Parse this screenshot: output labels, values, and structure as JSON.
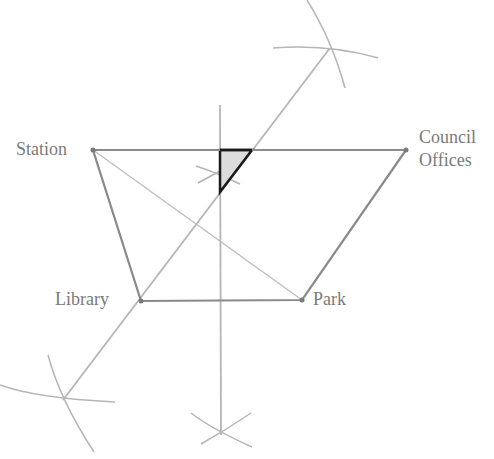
{
  "diagram": {
    "title": "",
    "colors": {
      "construction": "#b5b5b5",
      "quadrilateral": "#8a8a8a",
      "diagonal": "#bdbdbd",
      "triangle_stroke": "#1a1a1a",
      "triangle_fill": "#dcdcdc",
      "label": "#7a7a7a"
    },
    "points": {
      "station": {
        "label": "Station",
        "x": 93,
        "y": 150
      },
      "council_offices": {
        "label_line1": "Council",
        "label_line2": "Offices",
        "x": 406,
        "y": 150
      },
      "library": {
        "label": "Library",
        "x": 141,
        "y": 301
      },
      "park": {
        "label": "Park",
        "x": 302,
        "y": 300
      }
    },
    "construction_lines": {
      "angle_bisector": {
        "x1": 63,
        "y1": 400,
        "x2": 330,
        "y2": 48
      },
      "perpendicular": {
        "x1": 220,
        "y1": 105,
        "x2": 221,
        "y2": 435
      }
    },
    "shaded_region": {
      "vertices": [
        [
          220,
          150
        ],
        [
          252,
          150
        ],
        [
          220,
          192
        ]
      ]
    }
  }
}
